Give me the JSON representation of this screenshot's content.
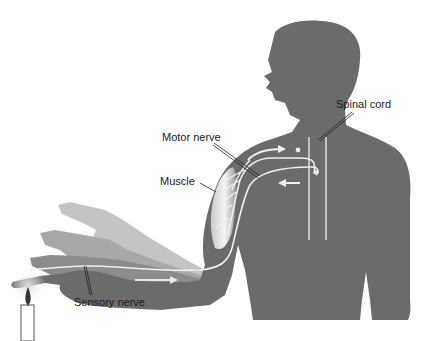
{
  "figure": {
    "labels": {
      "spinal_cord": "Spinal cord",
      "motor_nerve": "Motor nerve",
      "muscle": "Muscle",
      "sensory_nerve": "Sensory nerve"
    },
    "colors": {
      "silhouette": "#6b6b6b",
      "arm_ghost_1": "#bdbdbd",
      "arm_ghost_2": "#a3a3a3",
      "arm_ghost_3": "#8a8a8a",
      "nerve": "#f2f2f2",
      "background": "#ffffff"
    }
  }
}
